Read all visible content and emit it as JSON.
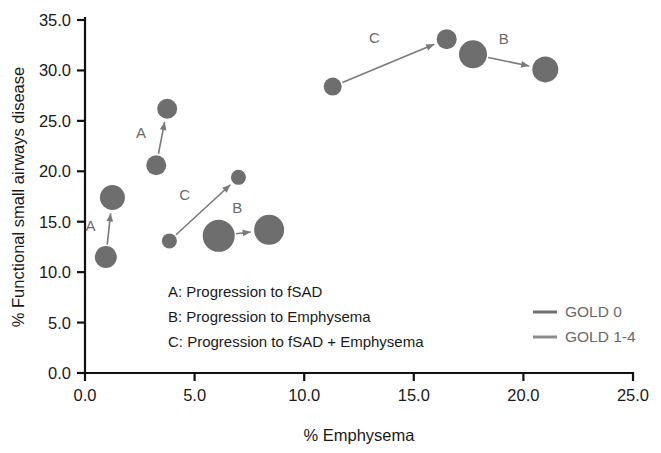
{
  "chart_data": {
    "type": "scatter",
    "title": "",
    "xlabel": "% Emphysema",
    "ylabel": "% Functional small airways disease",
    "xlim": [
      0.0,
      25.0
    ],
    "ylim": [
      0.0,
      35.0
    ],
    "xticks": [
      "0.0",
      "5.0",
      "10.0",
      "15.0",
      "20.0",
      "25.0"
    ],
    "yticks": [
      "0.0",
      "5.0",
      "10.0",
      "15.0",
      "20.0",
      "25.0",
      "30.0",
      "35.0"
    ],
    "grid": false,
    "marker_color": "#6e6e6e",
    "arrow_color": "#7a7a7a",
    "points": [
      {
        "id": "p1-start",
        "x": 0.95,
        "y": 11.5,
        "size": 11.0,
        "group": "A-low"
      },
      {
        "id": "p1-end",
        "x": 1.25,
        "y": 17.4,
        "size": 12.5,
        "group": "A-low"
      },
      {
        "id": "p2-start",
        "x": 3.25,
        "y": 20.6,
        "size": 10.0,
        "group": "A-mid"
      },
      {
        "id": "p2-end",
        "x": 3.75,
        "y": 26.2,
        "size": 10.0,
        "group": "A-mid"
      },
      {
        "id": "p3-start",
        "x": 3.85,
        "y": 13.1,
        "size": 7.5,
        "group": "C-mid"
      },
      {
        "id": "p3-end",
        "x": 7.0,
        "y": 19.4,
        "size": 7.5,
        "group": "C-mid"
      },
      {
        "id": "p4-start",
        "x": 6.1,
        "y": 13.6,
        "size": 16.0,
        "group": "B-mid"
      },
      {
        "id": "p4-end",
        "x": 8.4,
        "y": 14.2,
        "size": 15.0,
        "group": "B-mid"
      },
      {
        "id": "p5-start",
        "x": 11.3,
        "y": 28.4,
        "size": 9.0,
        "group": "C-high"
      },
      {
        "id": "p5-end",
        "x": 16.5,
        "y": 33.1,
        "size": 10.0,
        "group": "C-high"
      },
      {
        "id": "p6-start",
        "x": 17.7,
        "y": 31.6,
        "size": 14.0,
        "group": "B-high"
      },
      {
        "id": "p6-end",
        "x": 21.0,
        "y": 30.1,
        "size": 13.0,
        "group": "B-high"
      }
    ],
    "arrows": [
      {
        "label": "A",
        "from": [
          0.95,
          11.5
        ],
        "to": [
          1.25,
          17.4
        ],
        "label_pos": [
          0.25,
          14.1
        ]
      },
      {
        "label": "A",
        "from": [
          3.25,
          20.6
        ],
        "to": [
          3.75,
          26.2
        ],
        "label_pos": [
          2.55,
          23.3
        ]
      },
      {
        "label": "C",
        "from": [
          3.85,
          13.1
        ],
        "to": [
          7.0,
          19.4
        ],
        "label_pos": [
          4.55,
          17.2
        ]
      },
      {
        "label": "B",
        "from": [
          6.1,
          13.6
        ],
        "to": [
          8.4,
          14.2
        ],
        "label_pos": [
          6.95,
          15.9
        ]
      },
      {
        "label": "C",
        "from": [
          11.3,
          28.4
        ],
        "to": [
          16.5,
          33.1
        ],
        "label_pos": [
          13.2,
          32.7
        ]
      },
      {
        "label": "B",
        "from": [
          17.7,
          31.6
        ],
        "to": [
          21.0,
          30.1
        ],
        "label_pos": [
          19.1,
          32.6
        ]
      }
    ],
    "annotations": [
      "A: Progression to fSAD",
      "B: Progression to Emphysema",
      "C: Progression to fSAD + Emphysema"
    ],
    "legend": {
      "position": "bottom-right",
      "entries": [
        {
          "label": "GOLD 0",
          "color": "#707070"
        },
        {
          "label": "GOLD 1-4",
          "color": "#8c8c8c"
        }
      ]
    }
  }
}
